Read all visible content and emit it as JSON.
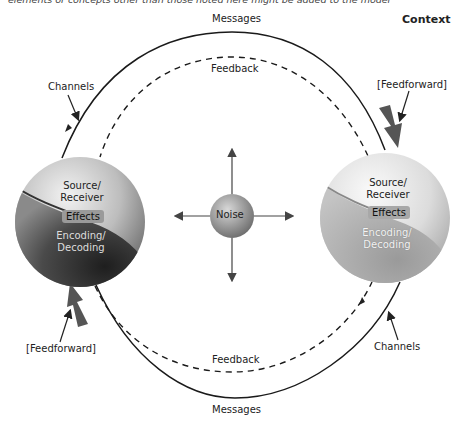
{
  "caption": "elements or concepts other than those noted here might be added to the model",
  "context_label": "Context",
  "labels": {
    "messages_top": "Messages",
    "messages_bottom": "Messages",
    "feedback_top": "Feedback",
    "feedback_bottom": "Feedback",
    "channels_left": "Channels",
    "channels_right": "Channels",
    "feedforward_right": "[Feedforward]",
    "feedforward_left": "[Feedforward]",
    "noise": "Noise"
  },
  "left_sphere": {
    "top": "Source/",
    "top2": "Receiver",
    "middle": "Effects",
    "bottom": "Encoding/",
    "bottom2": "Decoding",
    "shade": "dark"
  },
  "right_sphere": {
    "top": "Source/",
    "top2": "Receiver",
    "middle": "Effects",
    "bottom": "Encoding/",
    "bottom2": "Decoding",
    "shade": "light"
  },
  "colors": {
    "line": "#1a1a1a",
    "arrow_thick": "#555555",
    "sphere_light": "#e6e6e6",
    "sphere_dark": "#3a3a3a"
  }
}
